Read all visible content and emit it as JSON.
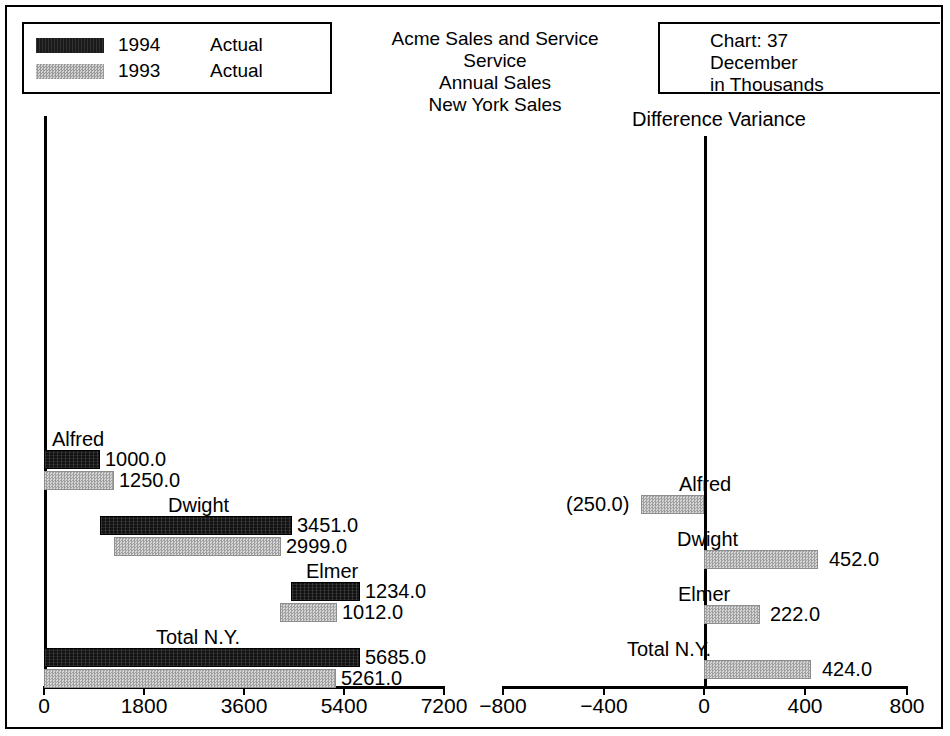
{
  "legend": {
    "entries": [
      {
        "year": "1994",
        "kind": "Actual",
        "swatch": "dark"
      },
      {
        "year": "1993",
        "kind": "Actual",
        "swatch": "gray"
      }
    ]
  },
  "title": {
    "line1": "Acme Sales and Service",
    "line2": "Service",
    "line3": "Annual Sales",
    "line4": "New York Sales"
  },
  "chart_info": {
    "chart": "Chart:  37",
    "period": "December",
    "units": "in Thousands"
  },
  "right_panel": {
    "heading": "Difference Variance"
  },
  "chart_data": [
    {
      "type": "bar",
      "orientation": "horizontal",
      "title": "Acme Sales and Service / Service / Annual Sales / New York Sales",
      "subtitle": "December, in Thousands",
      "xlabel": "",
      "ylabel": "",
      "grid": false,
      "legend_position": "top-left",
      "xlim": [
        0,
        7200
      ],
      "xticks": [
        0,
        1800,
        3600,
        5400,
        7200
      ],
      "xticklabels": [
        "0",
        "1800",
        "3600",
        "5400",
        "7200"
      ],
      "categories": [
        "Alfred",
        "Dwight",
        "Elmer",
        "Total N.Y."
      ],
      "series": [
        {
          "name": "1994 Actual",
          "color": "#121212",
          "values": [
            1000.0,
            3451.0,
            1234.0,
            5685.0
          ],
          "starts": [
            0.0,
            1000.0,
            4451.0,
            0.0
          ],
          "labels": [
            "1000.0",
            "3451.0",
            "1234.0",
            "5685.0"
          ]
        },
        {
          "name": "1993 Actual",
          "color": "#bcbcbc",
          "values": [
            1250.0,
            2999.0,
            1012.0,
            5261.0
          ],
          "starts": [
            0.0,
            1250.0,
            4249.0,
            0.0
          ],
          "labels": [
            "1250.0",
            "2999.0",
            "1012.0",
            "5261.0"
          ]
        }
      ]
    },
    {
      "type": "bar",
      "orientation": "horizontal",
      "title": "Difference Variance",
      "xlabel": "",
      "ylabel": "",
      "grid": false,
      "xlim": [
        -800,
        800
      ],
      "xticks": [
        -800,
        -400,
        0,
        400,
        800
      ],
      "xticklabels": [
        "−800",
        "−400",
        "0",
        "400",
        "800"
      ],
      "categories": [
        "Alfred",
        "Dwight",
        "Elmer",
        "Total N.Y."
      ],
      "series": [
        {
          "name": "Variance",
          "color": "#bcbcbc",
          "values": [
            -250.0,
            452.0,
            222.0,
            424.0
          ],
          "labels": [
            "(250.0)",
            "452.0",
            "222.0",
            "424.0"
          ]
        }
      ]
    }
  ],
  "left_axis": {
    "ticks": [
      {
        "label": "0",
        "x": 44
      },
      {
        "label": "1800",
        "x": 144
      },
      {
        "label": "3600",
        "x": 244
      },
      {
        "label": "5400",
        "x": 344
      },
      {
        "label": "7200",
        "x": 444
      }
    ]
  },
  "right_axis": {
    "ticks": [
      {
        "label": "−800",
        "x": 503
      },
      {
        "label": "−400",
        "x": 604
      },
      {
        "label": "0",
        "x": 704
      },
      {
        "label": "400",
        "x": 805
      },
      {
        "label": "800",
        "x": 907
      }
    ]
  },
  "left_groups": [
    {
      "name": "Alfred",
      "label_x": 52,
      "label_y": 428,
      "bar1": {
        "x": 44,
        "w": 56,
        "y": 450,
        "value": "1000.0",
        "value_x": 105,
        "value_y": 448
      },
      "bar2": {
        "x": 44,
        "w": 70,
        "y": 471,
        "value": "1250.0",
        "value_x": 119,
        "value_y": 469
      }
    },
    {
      "name": "Dwight",
      "label_x": 168,
      "label_y": 494,
      "bar1": {
        "x": 100,
        "w": 192,
        "y": 516,
        "value": "3451.0",
        "value_x": 297,
        "value_y": 514
      },
      "bar2": {
        "x": 114,
        "w": 167,
        "y": 537,
        "value": "2999.0",
        "value_x": 286,
        "value_y": 535
      }
    },
    {
      "name": "Elmer",
      "label_x": 306,
      "label_y": 560,
      "bar1": {
        "x": 291,
        "w": 69,
        "y": 582,
        "value": "1234.0",
        "value_x": 365,
        "value_y": 580
      },
      "bar2": {
        "x": 280,
        "w": 57,
        "y": 603,
        "value": "1012.0",
        "value_x": 342,
        "value_y": 601
      }
    },
    {
      "name": "Total N.Y.",
      "label_x": 156,
      "label_y": 626,
      "bar1": {
        "x": 44,
        "w": 316,
        "y": 648,
        "value": "5685.0",
        "value_x": 365,
        "value_y": 646
      },
      "bar2": {
        "x": 44,
        "w": 292,
        "y": 669,
        "value": "5261.0",
        "value_x": 341,
        "value_y": 667
      }
    }
  ],
  "right_groups": [
    {
      "name": "Alfred",
      "label_x": 679,
      "label_y": 473,
      "bar": {
        "x": 641,
        "w": 63,
        "y": 495,
        "value": "(250.0)",
        "value_x": 566,
        "value_y": 493
      }
    },
    {
      "name": "Dwight",
      "label_x": 677,
      "label_y": 528,
      "bar": {
        "x": 704,
        "w": 114,
        "y": 550,
        "value": "452.0",
        "value_x": 829,
        "value_y": 548
      }
    },
    {
      "name": "Elmer",
      "label_x": 678,
      "label_y": 583,
      "bar": {
        "x": 704,
        "w": 56,
        "y": 605,
        "value": "222.0",
        "value_x": 770,
        "value_y": 603
      }
    },
    {
      "name": "Total N.Y.",
      "label_x": 627,
      "label_y": 638,
      "bar": {
        "x": 704,
        "w": 107,
        "y": 660,
        "value": "424.0",
        "value_x": 822,
        "value_y": 658
      }
    }
  ]
}
